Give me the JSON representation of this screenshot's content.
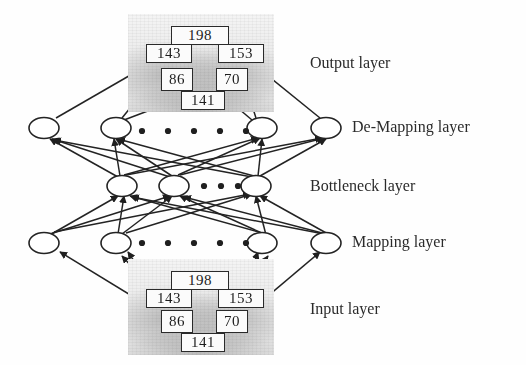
{
  "figure": {
    "type": "neural-network-architecture-diagram"
  },
  "labels": {
    "output_layer": "Output layer",
    "demapping_layer": "De-Mapping layer",
    "bottleneck_layer": "Bottleneck layer",
    "mapping_layer": "Mapping layer",
    "input_layer": "Input layer"
  },
  "colors": {
    "ink": "#1d1d1d",
    "stroke": "#2a2a2a",
    "photo_light": "#f4f4f4",
    "photo_dark": "#dcdcdc",
    "page": "#ffffff"
  },
  "output_block": {
    "name": "output-image-block",
    "values": [
      {
        "id": "out-198",
        "text": "198",
        "x": 171,
        "y": 26,
        "w": 58,
        "h": 19,
        "fs": 15
      },
      {
        "id": "out-143",
        "text": "143",
        "x": 146,
        "y": 44,
        "w": 46,
        "h": 19,
        "fs": 15
      },
      {
        "id": "out-153",
        "text": "153",
        "x": 218,
        "y": 44,
        "w": 46,
        "h": 19,
        "fs": 15
      },
      {
        "id": "out-86",
        "text": "86",
        "x": 161,
        "y": 68,
        "w": 32,
        "h": 23,
        "fs": 15
      },
      {
        "id": "out-70",
        "text": "70",
        "x": 216,
        "y": 68,
        "w": 32,
        "h": 23,
        "fs": 15
      },
      {
        "id": "out-141",
        "text": "141",
        "x": 181,
        "y": 91,
        "w": 44,
        "h": 19,
        "fs": 15
      }
    ]
  },
  "input_block": {
    "name": "input-image-block",
    "values": [
      {
        "id": "in-198",
        "text": "198",
        "x": 171,
        "y": 271,
        "w": 58,
        "h": 19,
        "fs": 15
      },
      {
        "id": "in-143",
        "text": "143",
        "x": 146,
        "y": 289,
        "w": 46,
        "h": 19,
        "fs": 15
      },
      {
        "id": "in-153",
        "text": "153",
        "x": 218,
        "y": 289,
        "w": 46,
        "h": 19,
        "fs": 15
      },
      {
        "id": "in-86",
        "text": "86",
        "x": 161,
        "y": 310,
        "w": 32,
        "h": 23,
        "fs": 15
      },
      {
        "id": "in-70",
        "text": "70",
        "x": 216,
        "y": 310,
        "w": 32,
        "h": 23,
        "fs": 15
      },
      {
        "id": "in-141",
        "text": "141",
        "x": 181,
        "y": 333,
        "w": 44,
        "h": 19,
        "fs": 15
      }
    ]
  },
  "layers": [
    {
      "key": "demapping",
      "name": "de-mapping-layer",
      "node_count_visible": 4,
      "ellipsis_dots": 5,
      "cy": 128,
      "nodes_x": [
        44,
        116,
        192,
        262,
        326
      ],
      "dots_x": [
        142,
        168,
        194,
        220,
        246
      ],
      "dots_y": 131
    },
    {
      "key": "bottleneck",
      "name": "bottleneck-layer",
      "node_count_visible": 3,
      "ellipsis_dots": 3,
      "cy": 186,
      "nodes_x": [
        122,
        174,
        256
      ],
      "dots_x": [
        204,
        221,
        238
      ],
      "dots_y": 186
    },
    {
      "key": "mapping",
      "name": "mapping-layer",
      "node_count_visible": 4,
      "ellipsis_dots": 5,
      "cy": 243,
      "nodes_x": [
        44,
        116,
        192,
        262,
        326
      ],
      "dots_x": [
        142,
        168,
        194,
        220,
        246
      ],
      "dots_y": 243
    }
  ],
  "label_positions": {
    "output_layer": {
      "x": 310,
      "y": 54
    },
    "demapping_layer": {
      "x": 352,
      "y": 118
    },
    "bottleneck_layer": {
      "x": 310,
      "y": 177
    },
    "mapping_layer": {
      "x": 352,
      "y": 233
    },
    "input_layer": {
      "x": 310,
      "y": 300
    }
  }
}
